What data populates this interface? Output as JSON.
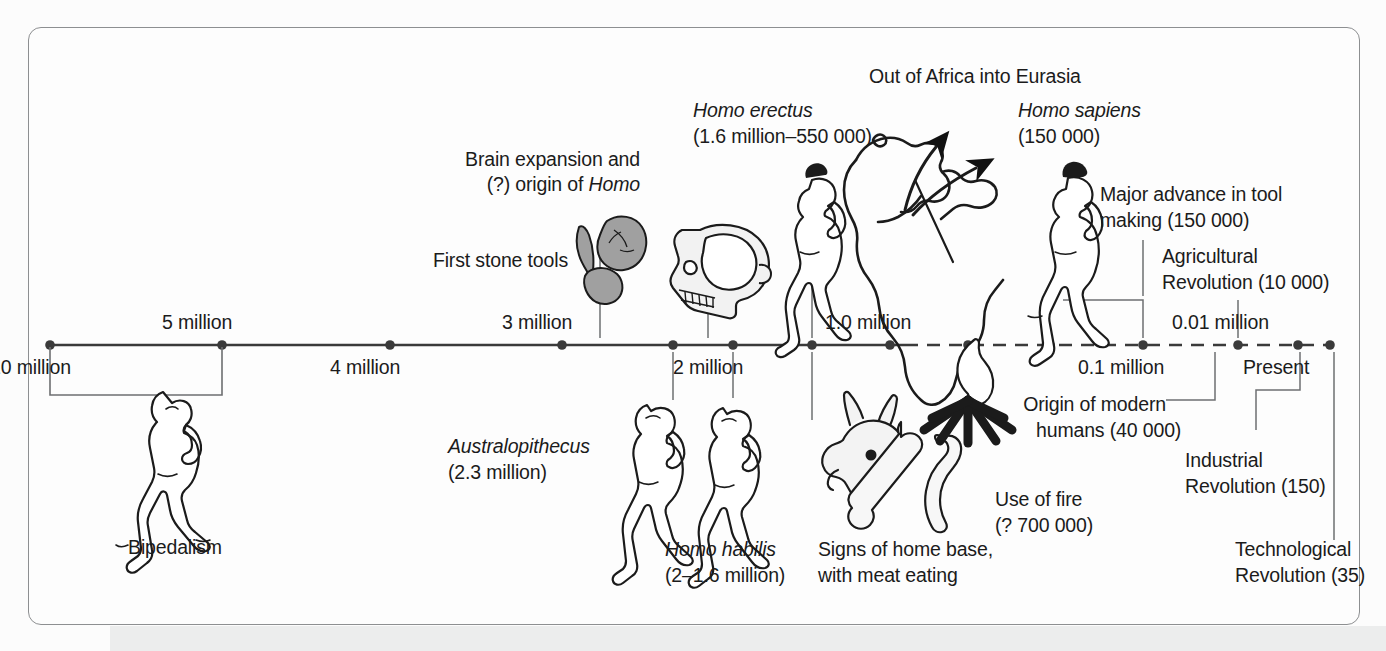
{
  "figure": {
    "type": "timeline-diagram",
    "title_visible": false,
    "axis": {
      "solid_from_label": "10 million",
      "dashed_note": "right portion of axis is dashed",
      "ticks_above": [
        {
          "label": "5 million",
          "x": 222
        },
        {
          "label": "3 million",
          "x": 562
        },
        {
          "label": "1.0 million",
          "x": 890
        },
        {
          "label": "0.01 million",
          "x": 1238
        }
      ],
      "ticks_below": [
        {
          "label": "10 million",
          "x": 50
        },
        {
          "label": "4 million",
          "x": 390
        },
        {
          "label": "2 million",
          "x": 733
        },
        {
          "label": "0.1 million",
          "x": 1143
        },
        {
          "label": "Present",
          "x": 1298
        }
      ]
    },
    "annotations": {
      "bipedalism": "Bipedalism",
      "first_stone_tools": "First stone tools",
      "brain_expansion_line1": "Brain expansion and",
      "brain_expansion_line2_pre": "(?) origin of ",
      "brain_expansion_line2_italic": "Homo",
      "australopithecus_name": "Australopithecus",
      "australopithecus_date": "(2.3 million)",
      "homo_habilis_name": "Homo habilis",
      "homo_habilis_date": "(2–1.6 million)",
      "homo_erectus_name": "Homo erectus",
      "homo_erectus_date": "(1.6 million–550 000)",
      "out_of_africa": "Out of Africa into Eurasia",
      "homo_sapiens_name": "Homo sapiens",
      "homo_sapiens_date": "(150 000)",
      "home_base_line1": "Signs of home base,",
      "home_base_line2": "with meat eating",
      "use_of_fire_line1": "Use of fire",
      "use_of_fire_line2": "(? 700 000)",
      "major_advance_line1": "Major advance in tool",
      "major_advance_line2": "making (150 000)",
      "agricultural_line1": "Agricultural",
      "agricultural_line2": "Revolution (10 000)",
      "origin_modern_line1": "Origin of modern",
      "origin_modern_line2": "humans (40 000)",
      "industrial_line1": "Industrial",
      "industrial_line2": "Revolution (150)",
      "technological_line1": "Technological",
      "technological_line2": "Revolution (35)"
    },
    "icons": {
      "bipedal_hominid": "walking-hominid-figure",
      "stone_tools": "stone-tools",
      "skull": "hominid-skull",
      "australopithecus_figure": "walking-australopithecus-figure",
      "habilis_figure": "walking-habilis-figure",
      "erectus_figure": "walking-erectus-figure",
      "sapiens_figure": "walking-sapiens-figure",
      "africa_map": "africa-map-with-migration-arrows",
      "animal_remains": "animal-skull-and-bones",
      "campfire": "campfire"
    },
    "colors": {
      "ink": "#1b1b1b",
      "frame": "#8d8f91",
      "axis": "#3a3a3a",
      "leader": "#6d6f71",
      "stone_fill": "#9d9d9d",
      "bone_fill": "#efefef",
      "page": "#fdfdfd",
      "band": "#eceded"
    }
  }
}
